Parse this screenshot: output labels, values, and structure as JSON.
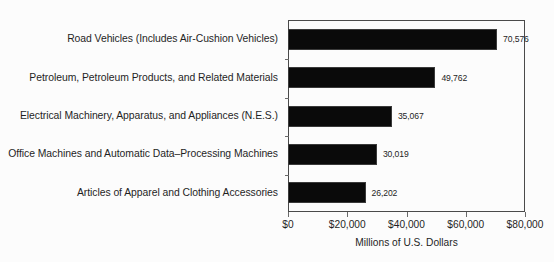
{
  "chart_data": {
    "type": "bar",
    "orientation": "horizontal",
    "title": "",
    "xlabel": "Millions of U.S. Dollars",
    "ylabel": "",
    "xlim": [
      0,
      80000
    ],
    "grid": false,
    "legend": null,
    "xtick_labels": [
      "$0",
      "$20,000",
      "$40,000",
      "$60,000",
      "$80,000"
    ],
    "xtick_values": [
      0,
      20000,
      40000,
      60000,
      80000
    ],
    "categories": [
      "Road Vehicles (Includes Air-Cushion Vehicles)",
      "Petroleum, Petroleum Products, and Related Materials",
      "Electrical Machinery, Apparatus, and Appliances (N.E.S.)",
      "Office Machines and Automatic Data–Processing Machines",
      "Articles of Apparel and Clothing Accessories"
    ],
    "values": [
      70576,
      49762,
      35067,
      30019,
      26202
    ],
    "value_labels": [
      "70,576",
      "49,762",
      "35,067",
      "30,019",
      "26,202"
    ],
    "bar_color": "#0a0a0a",
    "background_color": "#fcfcfc",
    "axis_color": "#4a4a4a"
  }
}
